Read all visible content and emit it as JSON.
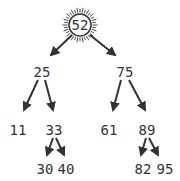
{
  "diagram": {
    "type": "binary-search-tree",
    "root": "52",
    "highlighted_node": "52",
    "colors": {
      "ink": "#333333",
      "background": "#ffffff"
    },
    "nodes": [
      {
        "id": "n52",
        "label": "52",
        "x": 80,
        "y": 25
      },
      {
        "id": "n25",
        "label": "25",
        "x": 42,
        "y": 72
      },
      {
        "id": "n75",
        "label": "75",
        "x": 125,
        "y": 72
      },
      {
        "id": "n11",
        "label": "11",
        "x": 18,
        "y": 130
      },
      {
        "id": "n33",
        "label": "33",
        "x": 54,
        "y": 130
      },
      {
        "id": "n61",
        "label": "61",
        "x": 109,
        "y": 130
      },
      {
        "id": "n89",
        "label": "89",
        "x": 147,
        "y": 130
      },
      {
        "id": "n30",
        "label": "30",
        "x": 45,
        "y": 170
      },
      {
        "id": "n40",
        "label": "40",
        "x": 66,
        "y": 170
      },
      {
        "id": "n82",
        "label": "82",
        "x": 143,
        "y": 170
      },
      {
        "id": "n95",
        "label": "95",
        "x": 165,
        "y": 170
      }
    ],
    "edges": [
      {
        "from": "52",
        "to": "25"
      },
      {
        "from": "52",
        "to": "75"
      },
      {
        "from": "25",
        "to": "11"
      },
      {
        "from": "25",
        "to": "33"
      },
      {
        "from": "75",
        "to": "61"
      },
      {
        "from": "75",
        "to": "89"
      },
      {
        "from": "33",
        "to": "30"
      },
      {
        "from": "33",
        "to": "40"
      },
      {
        "from": "89",
        "to": "82"
      },
      {
        "from": "89",
        "to": "95"
      }
    ]
  }
}
